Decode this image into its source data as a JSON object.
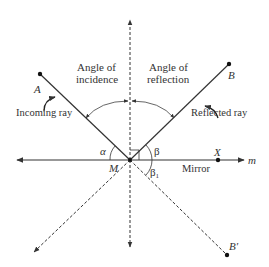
{
  "diagram": {
    "labels": {
      "angle_incidence_line1": "Angle of",
      "angle_incidence_line2": "incidence",
      "angle_reflection_line1": "Angle of",
      "angle_reflection_line2": "reflection",
      "incoming_ray": "Incoming ray",
      "reflected_ray": "Reflected ray",
      "mirror": "Mirror",
      "point_A": "A",
      "point_B": "B",
      "point_B_prime": "B′",
      "point_M": "M",
      "point_X": "X",
      "line_m": "m",
      "angle_alpha": "α",
      "angle_beta": "β",
      "angle_beta1_main": "β",
      "angle_beta1_sub": "1"
    },
    "colors": {
      "line": "#333333",
      "text": "#333333",
      "background": "#ffffff"
    }
  }
}
